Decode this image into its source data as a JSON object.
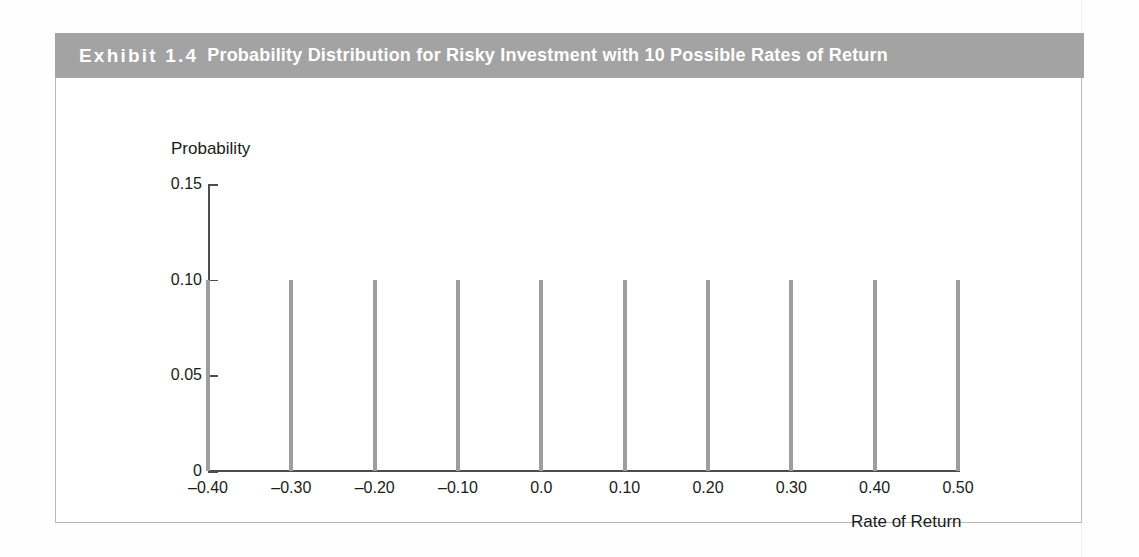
{
  "exhibit": {
    "number": "Exhibit 1.4",
    "title": "Probability Distribution for Risky Investment with 10 Possible Rates of Return",
    "header_color": "#a3a3a3",
    "border_color": "#b9b9b9"
  },
  "chart_data": {
    "type": "bar",
    "title": "Probability Distribution for Risky Investment with 10 Possible Rates of Return",
    "xlabel": "Rate of Return",
    "ylabel": "Probability",
    "categories": [
      "–0.40",
      "–0.30",
      "–0.20",
      "–0.10",
      "0.0",
      "0.10",
      "0.20",
      "0.30",
      "0.40",
      "0.50"
    ],
    "x": [
      -0.4,
      -0.3,
      -0.2,
      -0.1,
      0.0,
      0.1,
      0.2,
      0.3,
      0.4,
      0.5
    ],
    "values": [
      0.1,
      0.1,
      0.1,
      0.1,
      0.1,
      0.1,
      0.1,
      0.1,
      0.1,
      0.1
    ],
    "ylim": [
      0,
      0.15
    ],
    "yticks": [
      0,
      0.05,
      0.1,
      0.15
    ],
    "ytick_labels": [
      "0",
      "0.05",
      "0.10",
      "0.15"
    ],
    "grid": false,
    "legend": "none",
    "bar_color": "#9e9e9e",
    "axis_color": "#4d4d4d"
  }
}
